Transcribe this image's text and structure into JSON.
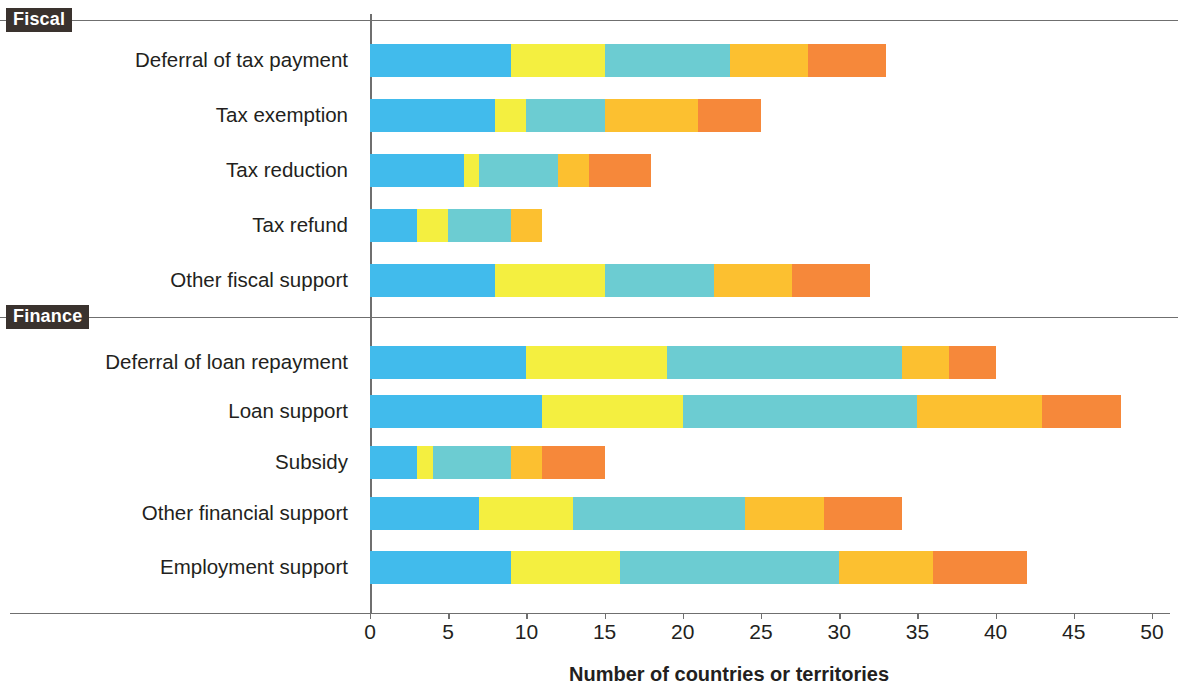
{
  "groups": [
    {
      "label": "Fiscal",
      "top": 8
    },
    {
      "label": "Finance",
      "top": 305
    }
  ],
  "axis": {
    "x_title": "Number of countries or territories",
    "ticks": [
      0,
      5,
      10,
      15,
      20,
      25,
      30,
      35,
      40,
      45,
      50
    ],
    "tick_labels": [
      "0",
      "5",
      "10",
      "15",
      "20",
      "25",
      "30",
      "35",
      "40",
      "45",
      "50"
    ]
  },
  "colors": {
    "blue": "#41bbec",
    "yellow": "#f4ef40",
    "teal": "#6cccd2",
    "amber": "#fcc030",
    "orange": "#f6883a",
    "rule": "#6f6f6f",
    "tag_bg": "#3a322e",
    "tag_fg": "#ffffff",
    "text": "#231f20"
  },
  "chart_data": {
    "type": "bar",
    "orientation": "horizontal",
    "stacked": true,
    "title": "",
    "xlabel": "Number of countries or territories",
    "ylabel": "",
    "xlim": [
      0,
      50
    ],
    "xticks": [
      0,
      5,
      10,
      15,
      20,
      25,
      30,
      35,
      40,
      45,
      50
    ],
    "grid": false,
    "legend": "none",
    "groups": [
      "Fiscal",
      "Finance"
    ],
    "categories": [
      "Deferral of tax payment",
      "Tax exemption",
      "Tax reduction",
      "Tax refund",
      "Other fiscal support",
      "Deferral of loan repayment",
      "Loan support",
      "Subsidy",
      "Other financial support",
      "Employment support"
    ],
    "category_groups": [
      "Fiscal",
      "Fiscal",
      "Fiscal",
      "Fiscal",
      "Fiscal",
      "Finance",
      "Finance",
      "Finance",
      "Finance",
      "Finance"
    ],
    "series": [
      {
        "name": "Series 1",
        "color": "#41bbec",
        "values": [
          9,
          8,
          6,
          3,
          8,
          10,
          11,
          3,
          7,
          9
        ]
      },
      {
        "name": "Series 2",
        "color": "#f4ef40",
        "values": [
          6,
          2,
          1,
          2,
          7,
          9,
          9,
          1,
          6,
          7
        ]
      },
      {
        "name": "Series 3",
        "color": "#6cccd2",
        "values": [
          8,
          5,
          5,
          4,
          7,
          15,
          15,
          5,
          11,
          14
        ]
      },
      {
        "name": "Series 4",
        "color": "#fcc030",
        "values": [
          5,
          6,
          2,
          2,
          5,
          3,
          8,
          2,
          5,
          6
        ]
      },
      {
        "name": "Series 5",
        "color": "#f6883a",
        "values": [
          5,
          4,
          4,
          0,
          5,
          3,
          5,
          4,
          5,
          6
        ]
      }
    ],
    "totals": [
      33,
      25,
      18,
      11,
      32,
      40,
      48,
      15,
      34,
      42
    ],
    "cumulative": [
      [
        9,
        15,
        23,
        28,
        33
      ],
      [
        8,
        10,
        15,
        21,
        25
      ],
      [
        6,
        7,
        12,
        14,
        18
      ],
      [
        3,
        5,
        9,
        11,
        11
      ],
      [
        8,
        15,
        22,
        27,
        32
      ],
      [
        10,
        19,
        34,
        37,
        40
      ],
      [
        11,
        20,
        35,
        43,
        48
      ],
      [
        3,
        4,
        9,
        11,
        15
      ],
      [
        7,
        13,
        24,
        29,
        34
      ],
      [
        9,
        16,
        30,
        36,
        42
      ]
    ]
  },
  "rows": [
    {
      "label": "Deferral of tax payment",
      "top": 41,
      "segments": [
        9,
        6,
        8,
        5,
        5
      ]
    },
    {
      "label": "Tax exemption",
      "top": 96,
      "segments": [
        8,
        2,
        5,
        6,
        4
      ]
    },
    {
      "label": "Tax reduction",
      "top": 151,
      "segments": [
        6,
        1,
        5,
        2,
        4
      ]
    },
    {
      "label": "Tax refund",
      "top": 206,
      "segments": [
        3,
        2,
        4,
        2,
        0
      ]
    },
    {
      "label": "Other fiscal support",
      "top": 261,
      "segments": [
        8,
        7,
        7,
        5,
        5
      ]
    },
    {
      "label": "Deferral of loan repayment",
      "top": 343,
      "segments": [
        10,
        9,
        15,
        3,
        3
      ]
    },
    {
      "label": "Loan support",
      "top": 392,
      "segments": [
        11,
        9,
        15,
        8,
        5
      ]
    },
    {
      "label": "Subsidy",
      "top": 443,
      "segments": [
        3,
        1,
        5,
        2,
        4
      ]
    },
    {
      "label": "Other financial support",
      "top": 494,
      "segments": [
        7,
        6,
        11,
        5,
        5
      ]
    },
    {
      "label": "Employment support",
      "top": 548,
      "segments": [
        9,
        7,
        14,
        6,
        6
      ]
    }
  ]
}
